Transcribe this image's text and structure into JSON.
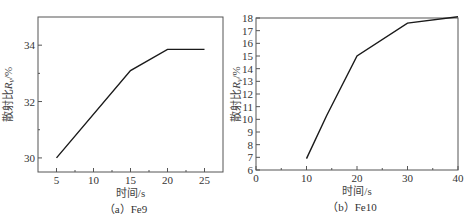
{
  "figure_title": "",
  "chart_data": [
    {
      "id": "fe9",
      "type": "line",
      "caption": "（a）Fe9",
      "xlabel": "时间/s",
      "ylabel": "散射比R_v/%",
      "xlim": [
        2.5,
        27.5
      ],
      "ylim": [
        29.5,
        35
      ],
      "xticks": [
        5,
        10,
        15,
        20,
        25
      ],
      "yticks": [
        30,
        32,
        34
      ],
      "grid": false,
      "x": [
        5,
        15,
        20,
        25
      ],
      "values": [
        30.0,
        33.1,
        33.85,
        33.85
      ],
      "series": [
        {
          "name": "Fe9",
          "x": [
            5,
            15,
            20,
            25
          ],
          "values": [
            30.0,
            33.1,
            33.85,
            33.85
          ]
        }
      ],
      "box": {
        "left": 38,
        "right": 223,
        "top": 17,
        "bottom": 172
      }
    },
    {
      "id": "fe10",
      "type": "line",
      "caption": "（b）Fe10",
      "xlabel": "时间/s",
      "ylabel": "散射比R_v/%",
      "xlim": [
        0,
        40
      ],
      "ylim": [
        6,
        18
      ],
      "xticks": [
        0,
        10,
        20,
        30,
        40
      ],
      "yticks": [
        6,
        7,
        8,
        9,
        10,
        11,
        12,
        13,
        14,
        15,
        16,
        17,
        18
      ],
      "grid": false,
      "x": [
        10,
        14,
        20,
        30,
        40
      ],
      "values": [
        6.9,
        10.3,
        15.0,
        17.6,
        18.1
      ],
      "series": [
        {
          "name": "Fe10",
          "x": [
            10,
            14,
            20,
            30,
            40
          ],
          "values": [
            6.9,
            10.3,
            15.0,
            17.6,
            18.1
          ]
        }
      ],
      "box": {
        "left": 256,
        "right": 458,
        "top": 18,
        "bottom": 170
      }
    }
  ],
  "colors": {
    "line": "#1a1a1a",
    "axis": "#555555",
    "text": "#333333"
  }
}
